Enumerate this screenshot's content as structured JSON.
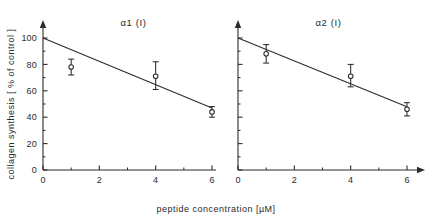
{
  "chart_data": {
    "type": "scatter",
    "title": "",
    "xlabel": "peptide  concentration [µM]",
    "ylabel": "collagen synthesis [ % of control ]",
    "xlim": [
      0,
      6.6
    ],
    "ylim": [
      0,
      105
    ],
    "grid": false,
    "legend": "none",
    "x_ticks_major": [
      "0",
      "2",
      "4",
      "6"
    ],
    "x_ticks_major_values": [
      0,
      2,
      4,
      6
    ],
    "x_ticks_minor_values": [
      1,
      3,
      5
    ],
    "y_ticks_major": [
      "0",
      "20",
      "40",
      "60",
      "80",
      "100"
    ],
    "y_ticks_major_values": [
      0,
      20,
      40,
      60,
      80,
      100
    ],
    "y_ticks_minor_values": [
      10,
      30,
      50,
      70,
      90
    ],
    "panels": [
      {
        "title": "α1 (I)",
        "points": [
          {
            "x": 1,
            "y": 78,
            "err_low": 6,
            "err_high": 6
          },
          {
            "x": 4,
            "y": 71,
            "err_low": 10,
            "err_high": 11
          },
          {
            "x": 6,
            "y": 44,
            "err_low": 4,
            "err_high": 4
          }
        ],
        "fit": {
          "x0": 0,
          "y0": 100,
          "x1": 6,
          "y1": 47
        }
      },
      {
        "title": "α2 (I)",
        "points": [
          {
            "x": 1,
            "y": 88,
            "err_low": 7,
            "err_high": 7
          },
          {
            "x": 4,
            "y": 71,
            "err_low": 8,
            "err_high": 9
          },
          {
            "x": 6,
            "y": 46,
            "err_low": 5,
            "err_high": 5
          }
        ],
        "fit": {
          "x0": 0,
          "y0": 100,
          "x1": 6,
          "y1": 48
        }
      }
    ]
  }
}
